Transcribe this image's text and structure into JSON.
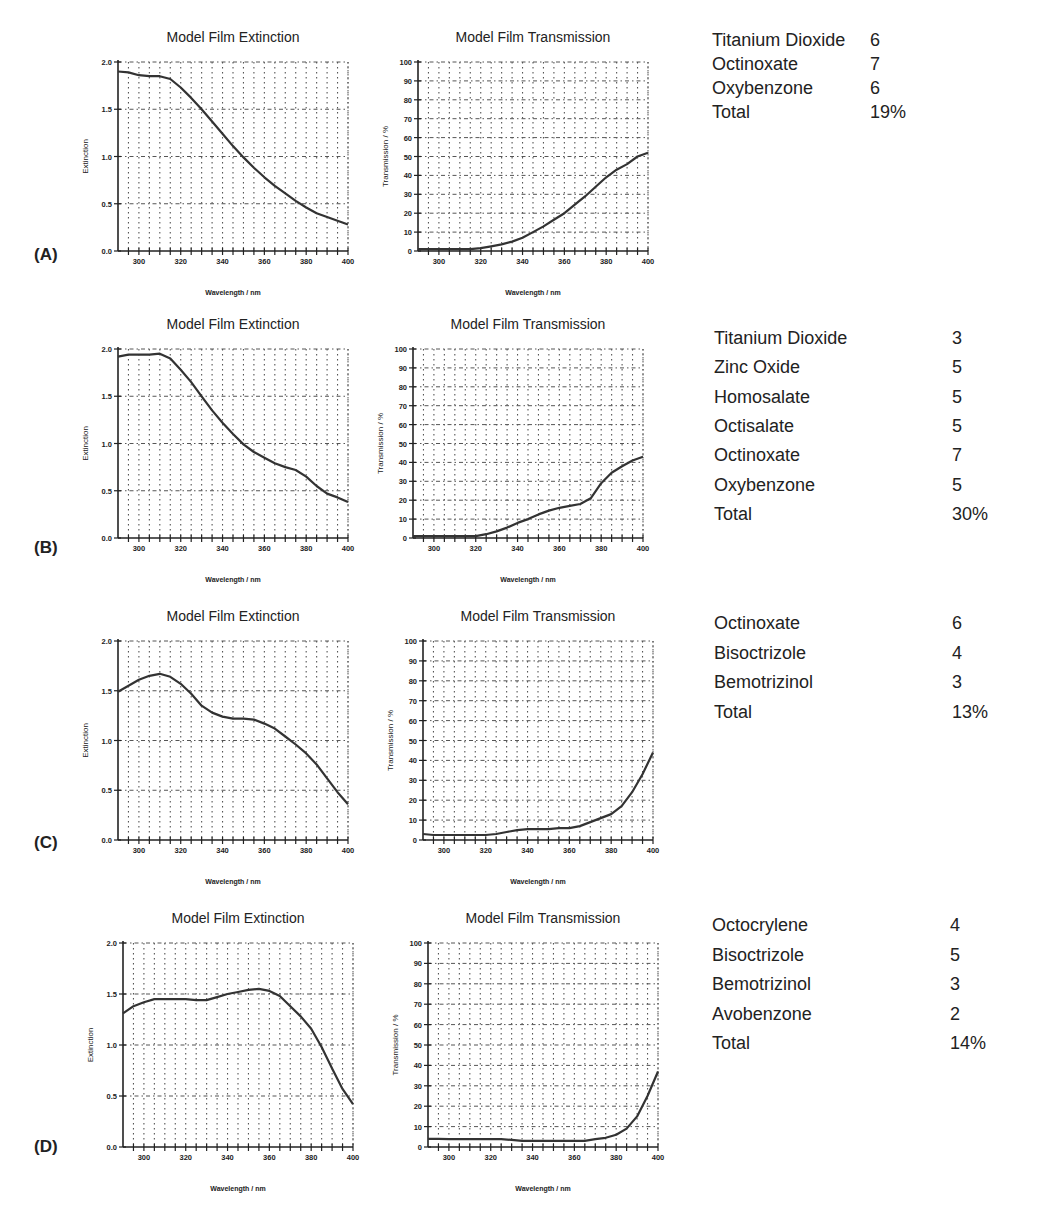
{
  "chart_data": [
    {
      "panel": "(A)",
      "type": "line",
      "charts": [
        {
          "title": "Model Film Extinction",
          "xlabel": "Wavelength / nm",
          "ylabel": "Extinction",
          "xlim": [
            290,
            400
          ],
          "ylim": [
            0.0,
            2.0
          ],
          "xticks": [
            300,
            320,
            340,
            360,
            380,
            400
          ],
          "yticks": [
            "0.0",
            "0.5",
            "1.0",
            "1.5",
            "2.0"
          ],
          "ytick_values": [
            0.0,
            0.5,
            1.0,
            1.5,
            2.0
          ],
          "grid": true,
          "x": [
            290,
            295,
            300,
            305,
            310,
            315,
            320,
            325,
            330,
            335,
            340,
            345,
            350,
            355,
            360,
            365,
            370,
            375,
            380,
            385,
            390,
            395,
            400
          ],
          "y": [
            1.9,
            1.89,
            1.86,
            1.85,
            1.85,
            1.82,
            1.73,
            1.62,
            1.5,
            1.37,
            1.24,
            1.11,
            0.99,
            0.88,
            0.78,
            0.69,
            0.61,
            0.53,
            0.46,
            0.4,
            0.36,
            0.32,
            0.28
          ]
        },
        {
          "title": "Model Film Transmission",
          "xlabel": "Wavelength / nm",
          "ylabel": "Transmission / %",
          "xlim": [
            290,
            400
          ],
          "ylim": [
            0,
            100
          ],
          "xticks": [
            300,
            320,
            340,
            360,
            380,
            400
          ],
          "yticks": [
            "0",
            "10",
            "20",
            "30",
            "40",
            "50",
            "60",
            "70",
            "80",
            "90",
            "100"
          ],
          "ytick_values": [
            0,
            10,
            20,
            30,
            40,
            50,
            60,
            70,
            80,
            90,
            100
          ],
          "grid": true,
          "x": [
            290,
            295,
            300,
            305,
            310,
            315,
            320,
            325,
            330,
            335,
            340,
            345,
            350,
            355,
            360,
            365,
            370,
            375,
            380,
            385,
            390,
            395,
            400
          ],
          "y": [
            1,
            1,
            1,
            1,
            1,
            1,
            1.5,
            2.5,
            3.5,
            5,
            7,
            10,
            13,
            16.5,
            20,
            24.5,
            29,
            34,
            39,
            43,
            46,
            50,
            52
          ]
        }
      ],
      "ingredients": [
        {
          "name": "Titanium Dioxide",
          "value": "6"
        },
        {
          "name": "Octinoxate",
          "value": "7"
        },
        {
          "name": "Oxybenzone",
          "value": "6"
        },
        {
          "name": "Total",
          "value": "19%"
        }
      ]
    },
    {
      "panel": "(B)",
      "type": "line",
      "charts": [
        {
          "title": "Model Film Extinction",
          "xlabel": "Wavelength / nm",
          "ylabel": "Extinction",
          "xlim": [
            290,
            400
          ],
          "ylim": [
            0.0,
            2.0
          ],
          "xticks": [
            300,
            320,
            340,
            360,
            380,
            400
          ],
          "yticks": [
            "0.0",
            "0.5",
            "1.0",
            "1.5",
            "2.0"
          ],
          "ytick_values": [
            0.0,
            0.5,
            1.0,
            1.5,
            2.0
          ],
          "grid": true,
          "x": [
            290,
            295,
            300,
            305,
            310,
            315,
            320,
            325,
            330,
            335,
            340,
            345,
            350,
            355,
            360,
            365,
            370,
            375,
            380,
            385,
            390,
            395,
            400
          ],
          "y": [
            1.92,
            1.94,
            1.94,
            1.94,
            1.95,
            1.9,
            1.78,
            1.65,
            1.5,
            1.35,
            1.22,
            1.1,
            0.99,
            0.91,
            0.85,
            0.79,
            0.75,
            0.72,
            0.65,
            0.55,
            0.47,
            0.43,
            0.38
          ]
        },
        {
          "title": "Model Film Transmission",
          "xlabel": "Wavelength / nm",
          "ylabel": "Transmission / %",
          "xlim": [
            290,
            400
          ],
          "ylim": [
            0,
            100
          ],
          "xticks": [
            300,
            320,
            340,
            360,
            380,
            400
          ],
          "yticks": [
            "0",
            "10",
            "20",
            "30",
            "40",
            "50",
            "60",
            "70",
            "80",
            "90",
            "100"
          ],
          "ytick_values": [
            0,
            10,
            20,
            30,
            40,
            50,
            60,
            70,
            80,
            90,
            100
          ],
          "grid": true,
          "x": [
            290,
            295,
            300,
            305,
            310,
            315,
            320,
            325,
            330,
            335,
            340,
            345,
            350,
            355,
            360,
            365,
            370,
            375,
            380,
            385,
            390,
            395,
            400
          ],
          "y": [
            1,
            1,
            1,
            1,
            1,
            1,
            1,
            2,
            3.5,
            5.5,
            8,
            10,
            12.5,
            14.5,
            16,
            17,
            18,
            21,
            29,
            34.5,
            38,
            41,
            43
          ]
        }
      ],
      "ingredients": [
        {
          "name": "Titanium Dioxide",
          "value": "3"
        },
        {
          "name": "Zinc Oxide",
          "value": "5"
        },
        {
          "name": "Homosalate",
          "value": "5"
        },
        {
          "name": "Octisalate",
          "value": "5"
        },
        {
          "name": "Octinoxate",
          "value": "7"
        },
        {
          "name": "Oxybenzone",
          "value": "5"
        },
        {
          "name": "Total",
          "value": "30%"
        }
      ]
    },
    {
      "panel": "(C)",
      "type": "line",
      "charts": [
        {
          "title": "Model Film Extinction",
          "xlabel": "Wavelength / nm",
          "ylabel": "Extinction",
          "xlim": [
            290,
            400
          ],
          "ylim": [
            0.0,
            2.0
          ],
          "xticks": [
            300,
            320,
            340,
            360,
            380,
            400
          ],
          "yticks": [
            "0.0",
            "0.5",
            "1.0",
            "1.5",
            "2.0"
          ],
          "ytick_values": [
            0.0,
            0.5,
            1.0,
            1.5,
            2.0
          ],
          "grid": true,
          "x": [
            290,
            295,
            300,
            305,
            310,
            315,
            320,
            325,
            330,
            335,
            340,
            345,
            350,
            355,
            360,
            365,
            370,
            375,
            380,
            385,
            390,
            395,
            400
          ],
          "y": [
            1.49,
            1.55,
            1.61,
            1.65,
            1.67,
            1.64,
            1.57,
            1.47,
            1.35,
            1.28,
            1.24,
            1.22,
            1.22,
            1.21,
            1.17,
            1.12,
            1.04,
            0.96,
            0.87,
            0.76,
            0.62,
            0.48,
            0.36
          ]
        },
        {
          "title": "Model Film Transmission",
          "xlabel": "Wavelength / nm",
          "ylabel": "Transmission / %",
          "xlim": [
            290,
            400
          ],
          "ylim": [
            0,
            100
          ],
          "xticks": [
            300,
            320,
            340,
            360,
            380,
            400
          ],
          "yticks": [
            "0",
            "10",
            "20",
            "30",
            "40",
            "50",
            "60",
            "70",
            "80",
            "90",
            "100"
          ],
          "ytick_values": [
            0,
            10,
            20,
            30,
            40,
            50,
            60,
            70,
            80,
            90,
            100
          ],
          "grid": true,
          "x": [
            290,
            295,
            300,
            305,
            310,
            315,
            320,
            325,
            330,
            335,
            340,
            345,
            350,
            355,
            360,
            365,
            370,
            375,
            380,
            385,
            390,
            395,
            400
          ],
          "y": [
            3,
            2.5,
            2.5,
            2.5,
            2.5,
            2.5,
            2.5,
            3,
            4,
            5,
            5.5,
            5.5,
            5.5,
            6,
            6,
            7,
            9,
            11,
            13,
            17,
            24,
            33,
            44
          ]
        }
      ],
      "ingredients": [
        {
          "name": "Octinoxate",
          "value": "6"
        },
        {
          "name": "Bisoctrizole",
          "value": "4"
        },
        {
          "name": "Bemotrizinol",
          "value": "3"
        },
        {
          "name": "Total",
          "value": "13%"
        }
      ]
    },
    {
      "panel": "(D)",
      "type": "line",
      "charts": [
        {
          "title": "Model Film Extinction",
          "xlabel": "Wavelength / nm",
          "ylabel": "Extinction",
          "xlim": [
            290,
            400
          ],
          "ylim": [
            0.0,
            2.0
          ],
          "xticks": [
            300,
            320,
            340,
            360,
            380,
            400
          ],
          "yticks": [
            "0.0",
            "0.5",
            "1.0",
            "1.5",
            "2.0"
          ],
          "ytick_values": [
            0.0,
            0.5,
            1.0,
            1.5,
            2.0
          ],
          "grid": true,
          "x": [
            290,
            295,
            300,
            305,
            310,
            315,
            320,
            325,
            330,
            335,
            340,
            345,
            350,
            355,
            360,
            365,
            370,
            375,
            380,
            385,
            390,
            395,
            400
          ],
          "y": [
            1.31,
            1.38,
            1.42,
            1.45,
            1.45,
            1.45,
            1.45,
            1.44,
            1.44,
            1.47,
            1.5,
            1.52,
            1.54,
            1.55,
            1.53,
            1.48,
            1.38,
            1.28,
            1.16,
            0.98,
            0.77,
            0.57,
            0.42
          ]
        },
        {
          "title": "Model Film Transmission",
          "xlabel": "Wavelength / nm",
          "ylabel": "Transmission / %",
          "xlim": [
            290,
            400
          ],
          "ylim": [
            0,
            100
          ],
          "xticks": [
            300,
            320,
            340,
            360,
            380,
            400
          ],
          "yticks": [
            "0",
            "10",
            "20",
            "30",
            "40",
            "50",
            "60",
            "70",
            "80",
            "90",
            "100"
          ],
          "ytick_values": [
            0,
            10,
            20,
            30,
            40,
            50,
            60,
            70,
            80,
            90,
            100
          ],
          "grid": true,
          "x": [
            290,
            295,
            300,
            305,
            310,
            315,
            320,
            325,
            330,
            335,
            340,
            345,
            350,
            355,
            360,
            365,
            370,
            375,
            380,
            385,
            390,
            395,
            400
          ],
          "y": [
            4,
            4,
            3.8,
            3.8,
            3.8,
            3.8,
            3.8,
            3.8,
            3.5,
            3,
            3,
            3,
            3,
            3,
            3,
            3,
            3.8,
            4.5,
            6,
            9,
            15,
            25,
            37
          ]
        }
      ],
      "ingredients": [
        {
          "name": "Octocrylene",
          "value": "4"
        },
        {
          "name": "Bisoctrizole",
          "value": "5"
        },
        {
          "name": "Bemotrizinol",
          "value": "3"
        },
        {
          "name": "Avobenzone",
          "value": "2"
        },
        {
          "name": "Total",
          "value": "14%"
        }
      ]
    }
  ],
  "styles": {
    "line_color": "#333333",
    "grid_color": "#555555",
    "text_color": "#222222"
  }
}
